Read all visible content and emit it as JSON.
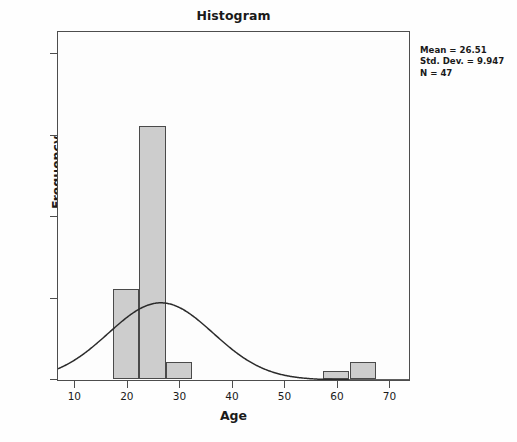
{
  "chart_data": {
    "type": "bar",
    "title": "Histogram",
    "xlabel": "Age",
    "ylabel": "Frequency",
    "xlim": [
      7,
      73.6
    ],
    "ylim": [
      0,
      42.5
    ],
    "grid": false,
    "legend": null,
    "bin_width": 5,
    "bins": [
      {
        "x0": 17.5,
        "x1": 22.5,
        "center": 20,
        "value": 11
      },
      {
        "x0": 22.5,
        "x1": 27.5,
        "center": 25,
        "value": 31
      },
      {
        "x0": 27.5,
        "x1": 32.5,
        "center": 30,
        "value": 2
      },
      {
        "x0": 57.5,
        "x1": 62.5,
        "center": 60,
        "value": 1
      },
      {
        "x0": 62.5,
        "x1": 67.5,
        "center": 65,
        "value": 2
      }
    ],
    "categories": [
      "17.5-22.5",
      "22.5-27.5",
      "27.5-32.5",
      "57.5-62.5",
      "62.5-67.5"
    ],
    "values": [
      11,
      31,
      2,
      1,
      2
    ],
    "xticks": [
      10,
      20,
      30,
      40,
      50,
      60,
      70
    ],
    "yticks": [
      0,
      10,
      20,
      30,
      40
    ],
    "normal_curve": {
      "mean": 26.51,
      "std_dev": 9.947,
      "n": 47,
      "peak_frequency": 9.42
    },
    "annotations": {
      "mean": "Mean = 26.51",
      "std_dev": "Std. Dev. = 9.947",
      "n": "N = 47"
    }
  }
}
